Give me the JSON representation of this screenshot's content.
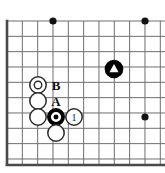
{
  "figure": {
    "kind": "go-board-diagram",
    "board": {
      "region": "upper-left-corner",
      "grid_spacing_px": 15.33,
      "origin_x_px": 7,
      "origin_y_px": 21,
      "columns": 10,
      "rows": 10,
      "edges_visible": [
        "left",
        "bottom"
      ],
      "line_color": "#6e6e6e",
      "edge_color": "#4a4a4a",
      "line_width_px": 1,
      "edge_width_px": 2.6,
      "background_color": "#ffffff"
    },
    "star_points": [
      {
        "name": "star-point-upper-left",
        "col": 3,
        "row": 0,
        "x": 53,
        "y": 21,
        "radius": 3.6,
        "color": "#111111"
      },
      {
        "name": "star-point-upper-right",
        "col": 9,
        "row": 0,
        "x": 145,
        "y": 21,
        "radius": 3.6,
        "color": "#111111"
      },
      {
        "name": "star-point-right",
        "col": 9,
        "row": 6,
        "x": 145,
        "y": 117,
        "radius": 3.6,
        "color": "#111111"
      }
    ],
    "stones": [
      {
        "name": "white-stone-marked-circle",
        "color": "white",
        "x": 38,
        "y": 85,
        "radius": 8.2,
        "mark": "circle",
        "mark_label": "",
        "fill": "#ffffff",
        "stroke": "#2b2b2b"
      },
      {
        "name": "white-stone-upper-middle",
        "color": "white",
        "x": 38,
        "y": 101,
        "radius": 8.2,
        "mark": "none",
        "mark_label": "",
        "fill": "#ffffff",
        "stroke": "#2b2b2b"
      },
      {
        "name": "white-stone-lower-left",
        "color": "white",
        "x": 38,
        "y": 117,
        "radius": 8.2,
        "mark": "none",
        "mark_label": "",
        "fill": "#ffffff",
        "stroke": "#2b2b2b"
      },
      {
        "name": "black-stone-marked-circle",
        "color": "black",
        "x": 56,
        "y": 117,
        "radius": 8.2,
        "mark": "circle",
        "mark_label": "",
        "fill": "#000000",
        "stroke": "#000000"
      },
      {
        "name": "white-stone-move-1",
        "color": "white",
        "x": 74,
        "y": 117,
        "radius": 8.2,
        "mark": "number",
        "mark_label": "1",
        "fill": "#ffffff",
        "stroke": "#2b2b2b"
      },
      {
        "name": "white-stone-bottom",
        "color": "white",
        "x": 56,
        "y": 133,
        "radius": 8.2,
        "mark": "none",
        "mark_label": "",
        "fill": "#ffffff",
        "stroke": "#2b2b2b"
      },
      {
        "name": "black-stone-marked-triangle",
        "color": "black",
        "x": 114,
        "y": 69,
        "radius": 8.6,
        "mark": "triangle",
        "mark_label": "",
        "fill": "#000000",
        "stroke": "#000000"
      }
    ],
    "labels": [
      {
        "name": "point-label-b",
        "text": "B",
        "x": 56,
        "y": 85,
        "font_size": 13
      },
      {
        "name": "point-label-a",
        "text": "A",
        "x": 56,
        "y": 101,
        "font_size": 13
      }
    ]
  }
}
